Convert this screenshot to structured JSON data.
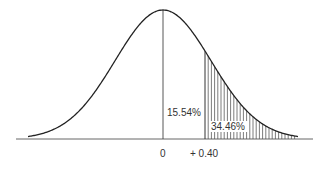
{
  "diagram": {
    "type": "normal-distribution-curve",
    "mean_label": "0",
    "z_label": "+ 0.40",
    "area_between_label": "15.54%",
    "tail_area_label": "34.46%",
    "shaded_region": "right tail beyond z = +0.40",
    "colors": {
      "line": "#222222",
      "background": "#ffffff",
      "hatch": "#333333"
    }
  }
}
